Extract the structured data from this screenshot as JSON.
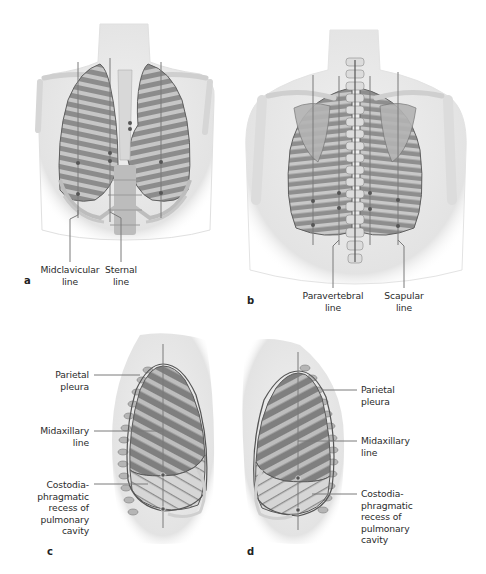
{
  "figure": {
    "colors": {
      "skin": "#ececec",
      "skin_shadow": "#d9d9d9",
      "lung_fill": "#8f8f8f",
      "lung_dark": "#6f6f6f",
      "rib": "#c9c9c9",
      "bone": "#dedede",
      "outline": "#5a5a5a",
      "guide_line": "#7a7a7a",
      "dot": "#555555",
      "recess_fill": "#cfcfcf",
      "text": "#2b2b2b"
    },
    "panels": [
      {
        "id": "a",
        "letter": "a",
        "view": "anterior thorax",
        "labels": [
          {
            "line1": "Midclavicular",
            "line2": "line"
          },
          {
            "line1": "Sternal",
            "line2": "line"
          }
        ]
      },
      {
        "id": "b",
        "letter": "b",
        "view": "posterior thorax",
        "labels": [
          {
            "line1": "Paravertebral",
            "line2": "line"
          },
          {
            "line1": "Scapular",
            "line2": "line"
          }
        ]
      },
      {
        "id": "c",
        "letter": "c",
        "view": "right lateral thorax",
        "labels": [
          {
            "lines": [
              "Parietal",
              "pleura"
            ]
          },
          {
            "lines": [
              "Midaxillary",
              "line"
            ]
          },
          {
            "lines": [
              "Costodia-",
              "phragmatic",
              "recess of",
              "pulmonary",
              "cavity"
            ]
          }
        ]
      },
      {
        "id": "d",
        "letter": "d",
        "view": "left lateral thorax",
        "labels": [
          {
            "lines": [
              "Parietal",
              "pleura"
            ]
          },
          {
            "lines": [
              "Midaxillary",
              "line"
            ]
          },
          {
            "lines": [
              "Costodia-",
              "phragmatic",
              "recess of",
              "pulmonary",
              "cavity"
            ]
          }
        ]
      }
    ],
    "caption": ""
  }
}
